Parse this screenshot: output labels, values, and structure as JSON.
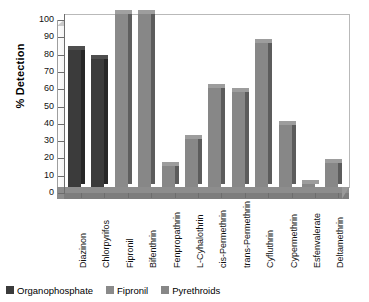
{
  "chart_data": {
    "type": "bar",
    "title": "",
    "xlabel": "",
    "ylabel": "% Detection",
    "ylim": [
      0,
      100
    ],
    "ytick_step": 10,
    "yticks": [
      0,
      10,
      20,
      30,
      40,
      50,
      60,
      70,
      80,
      90,
      100
    ],
    "grid": false,
    "legend_position": "bottom-left",
    "categories": [
      "Diazinon",
      "Chlorpyrifos",
      "Fipronil",
      "Bifenthrin",
      "Fenpropathrin",
      "L-Cyhalothrin",
      "cis-Permethrin",
      "trans-Permethrin",
      "Cyfluthrin",
      "Cypermethrin",
      "Esfenvalerate",
      "Deltamethrin"
    ],
    "values": [
      79,
      74,
      100,
      100,
      12,
      28,
      57,
      55,
      83,
      36,
      2,
      14
    ],
    "groups": [
      "Organophosphate",
      "Organophosphate",
      "Fipronil",
      "Pyrethroids",
      "Pyrethroids",
      "Pyrethroids",
      "Pyrethroids",
      "Pyrethroids",
      "Pyrethroids",
      "Pyrethroids",
      "Pyrethroids",
      "Pyrethroids"
    ],
    "series": [
      {
        "name": "Organophosphate",
        "color": "#3b3b3b",
        "points": [
          {
            "category": "Diazinon",
            "value": 79
          },
          {
            "category": "Chlorpyrifos",
            "value": 74
          }
        ]
      },
      {
        "name": "Fipronil",
        "color": "#8a8a8a",
        "points": [
          {
            "category": "Fipronil",
            "value": 100
          }
        ]
      },
      {
        "name": "Pyrethroids",
        "color": "#878787",
        "points": [
          {
            "category": "Bifenthrin",
            "value": 100
          },
          {
            "category": "Fenpropathrin",
            "value": 12
          },
          {
            "category": "L-Cyhalothrin",
            "value": 28
          },
          {
            "category": "cis-Permethrin",
            "value": 57
          },
          {
            "category": "trans-Permethrin",
            "value": 55
          },
          {
            "category": "Cyfluthrin",
            "value": 83
          },
          {
            "category": "Cypermethrin",
            "value": 36
          },
          {
            "category": "Esfenvalerate",
            "value": 2
          },
          {
            "category": "Deltamethrin",
            "value": 14
          }
        ]
      }
    ]
  },
  "legend": {
    "items": [
      {
        "label": "Organophosphate",
        "swatch": "op"
      },
      {
        "label": "Fipronil",
        "swatch": "fip"
      },
      {
        "label": "Pyrethroids",
        "swatch": "pyr"
      }
    ]
  },
  "colors": {
    "organophosphate": "#3b3b3b",
    "fipronil": "#8a8a8a",
    "pyrethroids": "#878787",
    "floor": "#8d8d8d",
    "axis": "#6d6d6d"
  }
}
